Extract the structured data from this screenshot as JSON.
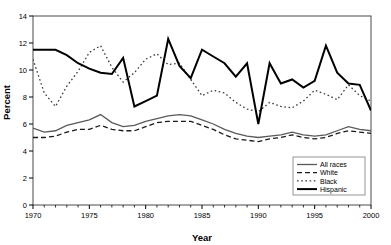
{
  "chart_data": {
    "type": "line",
    "title": "",
    "xlabel": "Year",
    "ylabel": "Percent",
    "xlim": [
      1970,
      2000
    ],
    "ylim": [
      0,
      14
    ],
    "xticks": [
      1970,
      1975,
      1980,
      1985,
      1990,
      1995,
      2000
    ],
    "yticks": [
      0,
      2,
      4,
      6,
      8,
      10,
      12,
      14
    ],
    "minor_xtick_step": 1,
    "grid": false,
    "legend_position": "bottom-right",
    "x": [
      1970,
      1971,
      1972,
      1973,
      1974,
      1975,
      1976,
      1977,
      1978,
      1979,
      1980,
      1981,
      1982,
      1983,
      1984,
      1985,
      1986,
      1987,
      1988,
      1989,
      1990,
      1991,
      1992,
      1993,
      1994,
      1995,
      1996,
      1997,
      1998,
      1999,
      2000
    ],
    "series": [
      {
        "name": "All races",
        "style": "solid",
        "color": "#5a5a5a",
        "width": 1.3,
        "values": [
          5.7,
          5.4,
          5.5,
          5.9,
          6.1,
          6.3,
          6.7,
          6.1,
          5.8,
          5.9,
          6.2,
          6.4,
          6.6,
          6.7,
          6.6,
          6.3,
          6.0,
          5.6,
          5.3,
          5.1,
          5.0,
          5.1,
          5.2,
          5.4,
          5.2,
          5.1,
          5.2,
          5.5,
          5.8,
          5.6,
          5.5
        ]
      },
      {
        "name": "White",
        "style": "dashed",
        "color": "#1a1a1a",
        "width": 1.3,
        "values": [
          5.0,
          5.0,
          5.1,
          5.4,
          5.6,
          5.6,
          5.9,
          5.6,
          5.5,
          5.5,
          5.8,
          6.1,
          6.2,
          6.2,
          6.2,
          5.9,
          5.6,
          5.2,
          4.9,
          4.8,
          4.7,
          4.9,
          5.0,
          5.2,
          5.0,
          4.9,
          5.0,
          5.3,
          5.5,
          5.4,
          5.3
        ]
      },
      {
        "name": "Black",
        "style": "dotted",
        "color": "#3a3a3a",
        "width": 1.3,
        "values": [
          10.8,
          8.3,
          7.3,
          8.8,
          9.9,
          11.3,
          11.8,
          10.2,
          9.1,
          9.8,
          10.8,
          11.2,
          10.4,
          10.5,
          9.3,
          8.1,
          8.5,
          8.3,
          7.6,
          7.1,
          6.9,
          7.6,
          7.3,
          7.2,
          7.7,
          8.5,
          8.2,
          7.8,
          8.9,
          8.1,
          7.7
        ]
      },
      {
        "name": "Hispanic",
        "style": "solid-bold",
        "color": "#000000",
        "width": 2.0,
        "values": [
          11.5,
          11.5,
          11.5,
          11.1,
          10.5,
          10.1,
          9.8,
          9.7,
          10.9,
          7.3,
          7.7,
          8.1,
          12.3,
          10.3,
          9.4,
          11.5,
          11.0,
          10.5,
          9.5,
          10.5,
          6.0,
          10.5,
          9.0,
          9.3,
          8.7,
          9.2,
          11.8,
          9.8,
          9.0,
          8.9,
          7.0
        ]
      }
    ]
  },
  "legend": {
    "items": [
      {
        "label": "All races"
      },
      {
        "label": "White"
      },
      {
        "label": "Black"
      },
      {
        "label": "Hispanic"
      }
    ]
  },
  "axes": {
    "x_title": "Year",
    "y_title": "Percent"
  }
}
